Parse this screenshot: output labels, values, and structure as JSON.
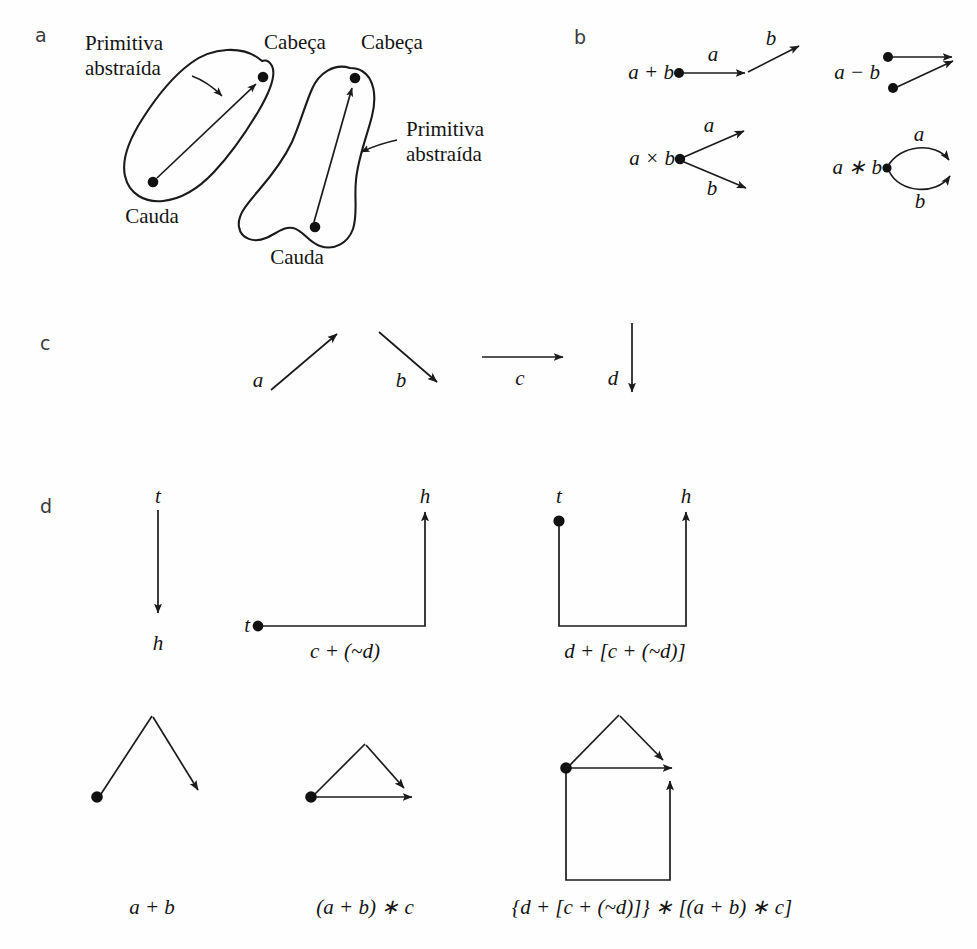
{
  "figure": {
    "background_color": "#fefefe",
    "ink_color": "#1b1b1b"
  },
  "panels": [
    {
      "id": "a",
      "letter": "a"
    },
    {
      "id": "b",
      "letter": "b"
    },
    {
      "id": "c",
      "letter": "c"
    },
    {
      "id": "d",
      "letter": "d"
    }
  ],
  "panel_a": {
    "labels": {
      "primitive_left_line1": "Primitiva",
      "primitive_left_line2": "abstraída",
      "head_left": "Cabeça",
      "head_right": "Cabeça",
      "primitive_right_line1": "Primitiva",
      "primitive_right_line2": "abstraída",
      "tail_left": "Cauda",
      "tail_right": "Cauda"
    }
  },
  "panel_b": {
    "items": [
      {
        "name": "addition",
        "label": "a + b"
      },
      {
        "name": "subtraction",
        "label": "a − b"
      },
      {
        "name": "multiplication",
        "label": "a × b"
      },
      {
        "name": "star",
        "label": "a ∗ b"
      }
    ],
    "edge_labels": {
      "add_first": "a",
      "add_second": "b",
      "mul_upper": "a",
      "mul_lower": "b",
      "star_upper": "a",
      "star_lower": "b"
    }
  },
  "panel_c": {
    "primitives": [
      {
        "name": "a",
        "label": "a",
        "direction": "up-right"
      },
      {
        "name": "b",
        "label": "b",
        "direction": "down-right"
      },
      {
        "name": "c",
        "label": "c",
        "direction": "right"
      },
      {
        "name": "d",
        "label": "d",
        "direction": "down"
      }
    ]
  },
  "panel_d": {
    "top_row": [
      {
        "name": "single-arc",
        "caption": "",
        "tail_label": "t",
        "head_label": "h"
      },
      {
        "name": "c-plus-not-d",
        "caption": "c + (~d)",
        "tail_label": "t",
        "head_label": "h"
      },
      {
        "name": "d-plus-group",
        "caption": "d + [c + (~d)]",
        "tail_label": "t",
        "head_label": "h"
      }
    ],
    "bottom_row": [
      {
        "name": "a-plus-b",
        "caption": "a + b"
      },
      {
        "name": "a-plus-b-star-c",
        "caption": "(a + b) ∗ c"
      },
      {
        "name": "full-expression",
        "caption": "{d + [c + (~d)]} ∗ [(a + b) ∗ c]"
      }
    ]
  }
}
